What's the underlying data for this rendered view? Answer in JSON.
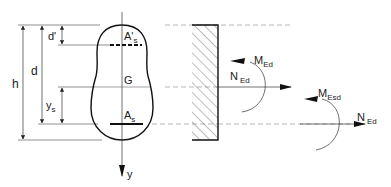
{
  "diagram": {
    "section": {
      "top_reinforcement_label": "A'",
      "top_reinforcement_sub": "s",
      "centroid_label": "G",
      "bottom_reinforcement_label": "A",
      "bottom_reinforcement_sub": "s",
      "axis_label": "y"
    },
    "dimensions": {
      "h": "h",
      "d": "d",
      "d_prime": "d'",
      "ys": "y",
      "ys_sub": "s"
    },
    "forces_at_centroid": {
      "moment": "M",
      "moment_sub": "Ed",
      "normal": "N",
      "normal_sub": "Ed"
    },
    "forces_at_reinforcement": {
      "moment": "M",
      "moment_sub": "Esd",
      "normal": "N",
      "normal_sub": "Ed"
    },
    "colors": {
      "line": "#222222",
      "dashed": "#888888"
    }
  }
}
